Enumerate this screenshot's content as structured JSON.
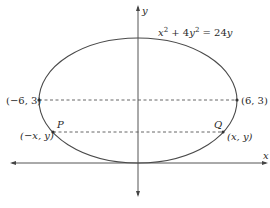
{
  "diagram": {
    "equation": {
      "x": "x",
      "sup1": "2",
      "plus": " + 4",
      "y": "y",
      "sup2": "2",
      "eq": " = 24",
      "y2": "y"
    },
    "axes": {
      "x_label": "x",
      "y_label": "y"
    },
    "points": {
      "left_vertex": "(−6, 3)",
      "right_vertex": "(6, 3)",
      "p_label": "P",
      "q_label": "Q",
      "p_coords": "(−x, y)",
      "q_coords": "(x, y)"
    }
  },
  "colors": {
    "stroke": "#4a4a4a",
    "text": "#2a2a2a"
  }
}
